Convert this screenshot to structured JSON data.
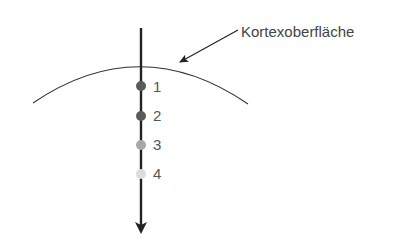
{
  "diagram": {
    "surface_label": "Kortexoberfläche",
    "electrode_points": [
      {
        "label": "1",
        "color": "#5a5a5a",
        "y": 85
      },
      {
        "label": "2",
        "color": "#5a5a5a",
        "y": 115
      },
      {
        "label": "3",
        "color": "#a8a8a8",
        "y": 144
      },
      {
        "label": "4",
        "color": "#dcdcdc",
        "y": 173
      }
    ],
    "colors": {
      "line": "#222222",
      "arc": "#333333",
      "text": "#555555"
    }
  }
}
